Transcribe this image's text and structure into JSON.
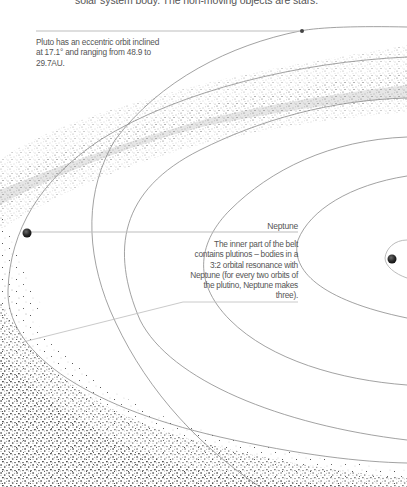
{
  "intro_text": "solar system body. The non-moving objects are stars.",
  "annotations": {
    "pluto": "Pluto has an eccentric orbit inclined at 17.1° and ranging from 48.9 to 29.7AU.",
    "neptune_label": "Neptune",
    "plutinos": "The inner part of the belt contains plutinos – bodies in a 3:2 orbital resonance with Neptune (for every two orbits of the plutino, Neptune makes three)."
  },
  "bodies": [
    {
      "name": "Pluto",
      "icon": "small-planet-dot"
    },
    {
      "name": "Neptune",
      "icon": "planet-sphere"
    },
    {
      "name": "Inner planet",
      "icon": "planet-sphere"
    }
  ],
  "colors": {
    "orbit_line": "#8a8a8a",
    "leader_line": "#bdbdbd",
    "belt_dust": "#7a7a7a",
    "text": "#555555",
    "planet": "#2b2b2b"
  }
}
